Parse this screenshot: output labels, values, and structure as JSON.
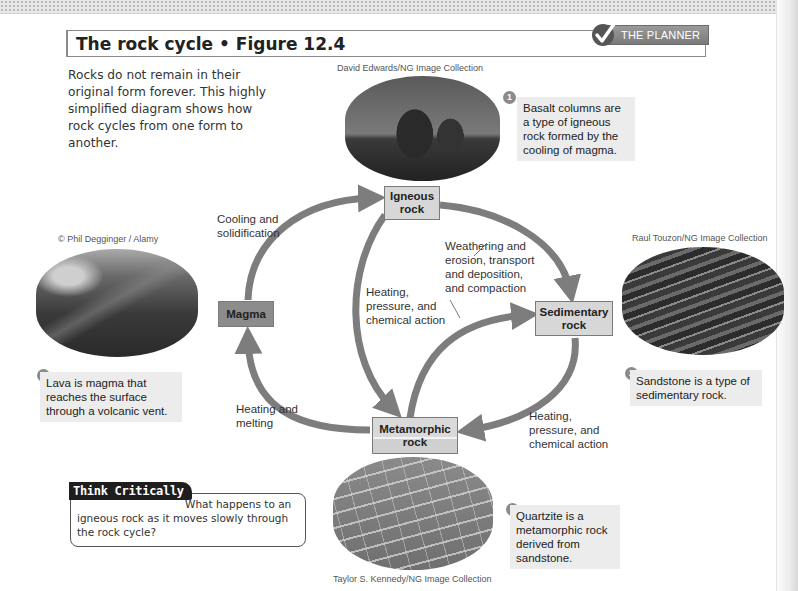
{
  "header": {
    "figure_title": "The rock cycle • Figure 12.4",
    "planner_label": "THE PLANNER"
  },
  "intro_text": "Rocks do not remain in their original form forever. This highly simplified diagram shows how rock cycles from one form to another.",
  "credits": {
    "igneous_photo": "David Edwards/NG Image Collection",
    "lava_photo": "© Phil Degginger / Alamy",
    "sandstone_photo": "Raul Touzon/NG Image Collection",
    "quartzite_photo": "Taylor S. Kennedy/NG Image Collection"
  },
  "callouts": [
    {
      "number": "1",
      "text": "Basalt columns are a type of igneous rock formed by the cooling of magma."
    },
    {
      "number": "2",
      "text": "Sandstone is a type of sedimentary rock."
    },
    {
      "number": "3",
      "text": "Quartzite is a metamorphic rock derived from sandstone."
    },
    {
      "number": "4",
      "text": "Lava is magma that reaches the surface through a volcanic vent."
    }
  ],
  "rock_types": {
    "igneous": "Igneous rock",
    "sedimentary": "Sedimentary rock",
    "metamorphic": "Metamorphic rock",
    "magma": "Magma"
  },
  "processes": {
    "magma_to_igneous": "Cooling and solidification",
    "igneous_to_sedimentary": "Weathering and erosion, transport and deposition, and compaction",
    "igneous_to_metamorphic": "Heating, pressure, and chemical action",
    "sedimentary_to_metamorphic": "Heating, pressure, and chemical action",
    "metamorphic_to_magma": "Heating and melting"
  },
  "think_critically": {
    "tag": "Think Critically",
    "question": "What happens to an igneous rock as it moves slowly through the rock cycle?"
  },
  "colors": {
    "arrow": "#7d7d7d",
    "box_fill": "#d7d7d7",
    "magma_fill": "#8c8c8c",
    "callout_bg": "#ececec"
  }
}
